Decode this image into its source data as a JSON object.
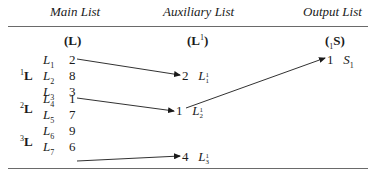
{
  "headers": {
    "main": "Main List",
    "auxiliary": "Auxiliary List",
    "output": "Output List"
  },
  "sub_headers": {
    "main": "(L)",
    "auxiliary_base": "L",
    "auxiliary_sup": "1",
    "output_pre_sub": "1",
    "output_base": "S"
  },
  "main_list": {
    "groups": [
      {
        "label": "L",
        "sup": "1",
        "row": 1
      },
      {
        "label": "L",
        "sup": "2",
        "row": 4
      },
      {
        "label": "L",
        "sup": "3",
        "row": 7
      }
    ],
    "rows": [
      {
        "name": "L",
        "sub": "1",
        "value": "2"
      },
      {
        "name": "L",
        "sub": "2",
        "value": "8"
      },
      {
        "name": "L",
        "sub": "3",
        "value": "3"
      },
      {
        "name": "L",
        "sub": "4",
        "value": "1"
      },
      {
        "name": "L",
        "sub": "5",
        "value": "7"
      },
      {
        "name": "L",
        "sub": "6",
        "value": "9"
      },
      {
        "name": "L",
        "sub": "7",
        "value": "6"
      },
      {
        "name": "L",
        "sub": "8",
        "value": "5"
      },
      {
        "name": "L",
        "sub": "9",
        "value": "4"
      }
    ]
  },
  "auxiliary_list": [
    {
      "value": "2",
      "name": "L",
      "sup": "1",
      "sub": "1"
    },
    {
      "value": "1",
      "name": "L",
      "sup": "1",
      "sub": "2"
    },
    {
      "value": "4",
      "name": "L",
      "sup": "1",
      "sub": "3"
    }
  ],
  "output_list": [
    {
      "value": "1",
      "name": "S",
      "sub": "1"
    }
  ],
  "arrows": [
    {
      "from": "main L1 (2)",
      "to": "aux L1_1 (2)"
    },
    {
      "from": "main L4 (1)",
      "to": "aux L1_2 (1)"
    },
    {
      "from": "main L9 (4)",
      "to": "aux L1_3 (4)"
    },
    {
      "from": "aux L1_2 (1)",
      "to": "output S1 (1)"
    }
  ]
}
